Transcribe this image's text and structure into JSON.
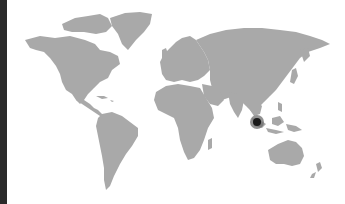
{
  "map": {
    "type": "world-map",
    "land_color": "#a9a9a9",
    "background_color": "#ffffff",
    "left_border_color": "#2a2a2a",
    "markers": [
      {
        "region": "Sumatra / Indonesia",
        "x": 257,
        "y": 122,
        "dot_color": "#1a1a1a",
        "halo_color": "#6e6e6e"
      }
    ]
  }
}
